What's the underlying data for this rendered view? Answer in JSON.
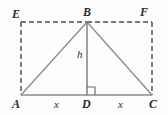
{
  "figure": {
    "background_color": "#fdfdfd",
    "solid_stroke_color": "#8a8a8a",
    "dashed_stroke_color": "#4a4a4a",
    "label_color": "#2b2b2b",
    "vertices": {
      "E": {
        "label": "E",
        "x": 21,
        "y": 22
      },
      "B": {
        "label": "B",
        "x": 87,
        "y": 22
      },
      "F": {
        "label": "F",
        "x": 152,
        "y": 22
      },
      "A": {
        "label": "A",
        "x": 21,
        "y": 95
      },
      "D": {
        "label": "D",
        "x": 87,
        "y": 95
      },
      "C": {
        "label": "C",
        "x": 152,
        "y": 95
      }
    },
    "labels": {
      "E": "E",
      "B": "B",
      "F": "F",
      "A": "A",
      "D": "D",
      "C": "C",
      "altitude": "h",
      "base_left": "x",
      "base_right": "x"
    },
    "segments": [
      {
        "name": "rectangle-top-left",
        "from": "E",
        "to": "B",
        "style": "dashed"
      },
      {
        "name": "rectangle-top-right",
        "from": "B",
        "to": "F",
        "style": "dashed"
      },
      {
        "name": "rectangle-left-side",
        "from": "E",
        "to": "A",
        "style": "dashed"
      },
      {
        "name": "rectangle-right-side",
        "from": "F",
        "to": "C",
        "style": "dashed"
      },
      {
        "name": "triangle-base",
        "from": "A",
        "to": "C",
        "style": "solid"
      },
      {
        "name": "triangle-left-leg",
        "from": "A",
        "to": "B",
        "style": "solid"
      },
      {
        "name": "triangle-right-leg",
        "from": "B",
        "to": "C",
        "style": "solid"
      },
      {
        "name": "altitude-line",
        "from": "B",
        "to": "D",
        "style": "solid"
      }
    ],
    "right_angle": {
      "name": "right-angle-marker",
      "at": "D",
      "size": 8,
      "side": "right"
    },
    "dash_pattern": "5,3"
  }
}
